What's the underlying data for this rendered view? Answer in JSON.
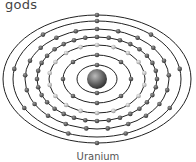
{
  "header_fragment": "gods",
  "diagram": {
    "title": "Uranium",
    "type": "bohr-atom-model",
    "shells": [
      {
        "rx": 20,
        "ry": 14,
        "electrons": 2,
        "color": "#444"
      },
      {
        "rx": 34,
        "ry": 24,
        "electrons": 8,
        "color": "#444"
      },
      {
        "rx": 48,
        "ry": 34,
        "electrons": 18,
        "color": "#bbb"
      },
      {
        "rx": 60,
        "ry": 42,
        "electrons": 32,
        "color": "#444"
      },
      {
        "rx": 72,
        "ry": 50,
        "electrons": 21,
        "color": "#444"
      },
      {
        "rx": 84,
        "ry": 58,
        "electrons": 9,
        "color": "#444"
      },
      {
        "rx": 94,
        "ry": 64,
        "electrons": 2,
        "color": "#444"
      }
    ],
    "nucleus_color": "#555",
    "orbit_color": "#222"
  }
}
